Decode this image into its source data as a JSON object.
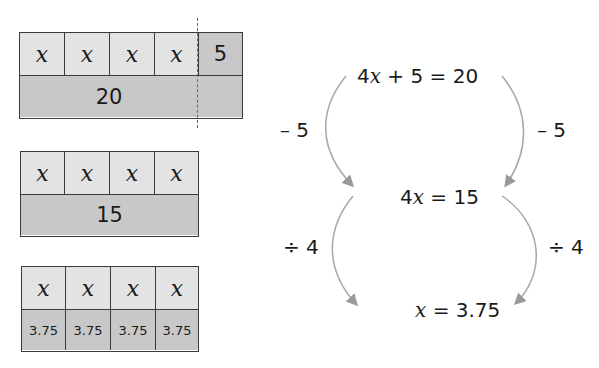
{
  "colors": {
    "cell_light": "#e3e3e3",
    "cell_dark": "#c8c8c8",
    "border": "#3a3a3a",
    "arrow": "#9a9a9a"
  },
  "tape1": {
    "top_cells": [
      "x",
      "x",
      "x",
      "x",
      "5"
    ],
    "bottom": "20"
  },
  "tape2": {
    "top_cells": [
      "x",
      "x",
      "x",
      "x"
    ],
    "bottom": "15"
  },
  "tape3": {
    "top_cells": [
      "x",
      "x",
      "x",
      "x"
    ],
    "bottom_cells": [
      "3.75",
      "3.75",
      "3.75",
      "3.75"
    ]
  },
  "equations": {
    "step1": {
      "coef": "4",
      "var": "x",
      "rest": " + 5 = 20"
    },
    "step2": {
      "coef": "4",
      "var": "x",
      "rest": " = 15"
    },
    "step3": {
      "coef": "",
      "var": "x",
      "rest": " = 3.75"
    }
  },
  "operations": {
    "left1": "– 5",
    "right1": "– 5",
    "left2": "÷ 4",
    "right2": "÷ 4"
  }
}
